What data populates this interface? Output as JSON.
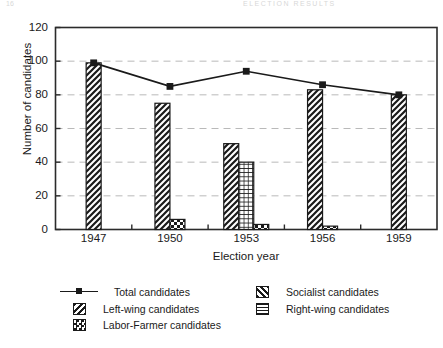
{
  "cropped_header": {
    "left": "16",
    "right": "ELECTION RESULTS"
  },
  "chart_data": {
    "type": "bar",
    "title": "",
    "subtitle": "",
    "xlabel": "Election year",
    "ylabel": "Number of candidates",
    "categories": [
      "1947",
      "1950",
      "1953",
      "1956",
      "1959"
    ],
    "ylim": [
      0,
      120
    ],
    "yticks": [
      0,
      20,
      40,
      60,
      80,
      100,
      120
    ],
    "ytick_labels": [
      "0",
      "20",
      "40",
      "60",
      "80",
      "100",
      "120"
    ],
    "grid": true,
    "grid_axis": "y",
    "legend_position": "below",
    "series": [
      {
        "name": "Total candidates",
        "kind": "line",
        "marker": "square",
        "color": "#1a1a1a",
        "values": [
          99,
          85,
          94,
          86,
          80
        ]
      },
      {
        "name": "Socialist candidates",
        "kind": "bar",
        "pattern": "diagonal-up-hatch",
        "values": [
          99,
          75,
          51,
          83,
          80
        ]
      },
      {
        "name": "Left-wing candidates",
        "kind": "bar",
        "pattern": "diagonal-down-hatch",
        "values": [
          0,
          0,
          0,
          0,
          0
        ]
      },
      {
        "name": "Right-wing candidates",
        "kind": "bar",
        "pattern": "grid-crosshatch",
        "values": [
          0,
          0,
          40,
          0,
          0
        ]
      },
      {
        "name": "Labor-Farmer candidates",
        "kind": "bar",
        "pattern": "checkerboard",
        "values": [
          0,
          6,
          3,
          2,
          0
        ]
      }
    ]
  },
  "legend": {
    "entries": [
      {
        "label": "Total candidates",
        "swatch": "line-marker-square"
      },
      {
        "label": "Left-wing candidates",
        "swatch": "diagonal-down-hatch"
      },
      {
        "label": "Labor-Farmer candidates",
        "swatch": "checkerboard"
      },
      {
        "label": "Socialist candidates",
        "swatch": "diagonal-up-hatch"
      },
      {
        "label": "Right-wing candidates",
        "swatch": "grid-crosshatch"
      }
    ]
  }
}
